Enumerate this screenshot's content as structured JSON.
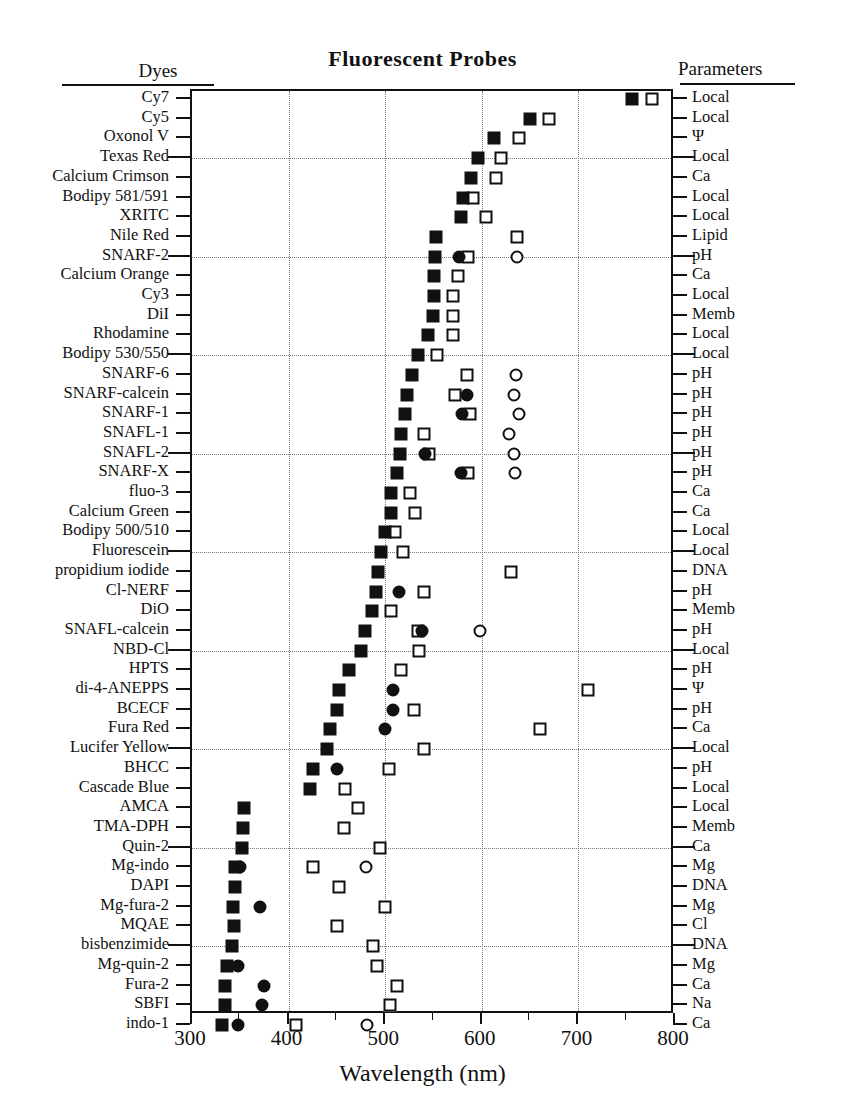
{
  "title": "Fluorescent  Probes",
  "headers": {
    "left": "Dyes",
    "right": "Parameters"
  },
  "chart_data": {
    "type": "scatter",
    "title": "Fluorescent  Probes",
    "xlabel": "Wavelength (nm)",
    "ylabel": "Dyes",
    "xlim": [
      300,
      800
    ],
    "xticks": [
      300,
      400,
      500,
      600,
      700,
      800
    ],
    "xtick_labels": [
      "300",
      "400",
      "500",
      "600",
      "700",
      "800"
    ],
    "xminor_ticks": [
      350,
      450,
      550,
      650,
      750
    ],
    "grid": "dotted, vertical every 100 nm, horizontal every 4th dye row",
    "legend": "none",
    "marker_meaning": {
      "filled-square": "primary excitation maximum",
      "filled-circle": "secondary excitation maximum",
      "open-square": "primary emission maximum",
      "open-circle": "secondary emission maximum"
    },
    "series": [
      {
        "name": "filled-square",
        "marker": "filled-square",
        "fill": "solid",
        "shape": "square"
      },
      {
        "name": "filled-circle",
        "marker": "filled-circle",
        "fill": "solid",
        "shape": "circle"
      },
      {
        "name": "open-square",
        "marker": "open-square",
        "fill": "open",
        "shape": "square"
      },
      {
        "name": "open-circle",
        "marker": "open-circle",
        "fill": "open",
        "shape": "circle"
      }
    ],
    "rows": [
      {
        "dye": "Cy7",
        "param": "Local",
        "filled_square": 755,
        "filled_circle": null,
        "open_square": 776,
        "open_circle": null
      },
      {
        "dye": "Cy5",
        "param": "Local",
        "filled_square": 650,
        "filled_circle": null,
        "open_square": 670,
        "open_circle": null
      },
      {
        "dye": "Oxonol V",
        "param": "Ψ",
        "filled_square": 613,
        "filled_circle": null,
        "open_square": 638,
        "open_circle": null
      },
      {
        "dye": "Texas Red",
        "param": "Local",
        "filled_square": 596,
        "filled_circle": null,
        "open_square": 620,
        "open_circle": null
      },
      {
        "dye": "Calcium Crimson",
        "param": "Ca",
        "filled_square": 589,
        "filled_circle": null,
        "open_square": 615,
        "open_circle": null
      },
      {
        "dye": "Bodipy 581/591",
        "param": "Local",
        "filled_square": 581,
        "filled_circle": null,
        "open_square": 591,
        "open_circle": null
      },
      {
        "dye": "XRITC",
        "param": "Local",
        "filled_square": 578,
        "filled_circle": null,
        "open_square": 604,
        "open_circle": null
      },
      {
        "dye": "Nile Red",
        "param": "Lipid",
        "filled_square": 553,
        "filled_circle": null,
        "open_square": 636,
        "open_circle": null
      },
      {
        "dye": "SNARF-2",
        "param": "pH",
        "filled_square": 552,
        "filled_circle": 576,
        "open_square": 586,
        "open_circle": 636
      },
      {
        "dye": "Calcium Orange",
        "param": "Ca",
        "filled_square": 550,
        "filled_circle": null,
        "open_square": 575,
        "open_circle": null
      },
      {
        "dye": "Cy3",
        "param": "Local",
        "filled_square": 550,
        "filled_circle": null,
        "open_square": 570,
        "open_circle": null
      },
      {
        "dye": "DiI",
        "param": "Memb",
        "filled_square": 549,
        "filled_circle": null,
        "open_square": 570,
        "open_circle": null
      },
      {
        "dye": "Rhodamine",
        "param": "Local",
        "filled_square": 544,
        "filled_circle": null,
        "open_square": 570,
        "open_circle": null
      },
      {
        "dye": "Bodipy 530/550",
        "param": "Local",
        "filled_square": 534,
        "filled_circle": null,
        "open_square": 554,
        "open_circle": null
      },
      {
        "dye": "SNARF-6",
        "param": "pH",
        "filled_square": 528,
        "filled_circle": null,
        "open_square": 585,
        "open_circle": 635
      },
      {
        "dye": "SNARF-calcein",
        "param": "pH",
        "filled_square": 523,
        "filled_circle": 585,
        "open_square": 572,
        "open_circle": 633
      },
      {
        "dye": "SNARF-1",
        "param": "pH",
        "filled_square": 521,
        "filled_circle": 580,
        "open_square": 588,
        "open_circle": 639
      },
      {
        "dye": "SNAFL-1",
        "param": "pH",
        "filled_square": 516,
        "filled_circle": null,
        "open_square": 540,
        "open_circle": 628
      },
      {
        "dye": "SNAFL-2",
        "param": "pH",
        "filled_square": 515,
        "filled_circle": 541,
        "open_square": 545,
        "open_circle": 633
      },
      {
        "dye": "SNARF-X",
        "param": "pH",
        "filled_square": 512,
        "filled_circle": 578,
        "open_square": 586,
        "open_circle": 634
      },
      {
        "dye": "fluo-3",
        "param": "Ca",
        "filled_square": 506,
        "filled_circle": null,
        "open_square": 526,
        "open_circle": null
      },
      {
        "dye": "Calcium Green",
        "param": "Ca",
        "filled_square": 506,
        "filled_circle": null,
        "open_square": 531,
        "open_circle": null
      },
      {
        "dye": "Bodipy 500/510",
        "param": "Local",
        "filled_square": 500,
        "filled_circle": null,
        "open_square": 510,
        "open_circle": null
      },
      {
        "dye": "Fluorescein",
        "param": "Local",
        "filled_square": 496,
        "filled_circle": null,
        "open_square": 518,
        "open_circle": null
      },
      {
        "dye": "propidium iodide",
        "param": "DNA",
        "filled_square": 493,
        "filled_circle": null,
        "open_square": 630,
        "open_circle": null
      },
      {
        "dye": "Cl-NERF",
        "param": "pH",
        "filled_square": 490,
        "filled_circle": 514,
        "open_square": 540,
        "open_circle": null
      },
      {
        "dye": "DiO",
        "param": "Memb",
        "filled_square": 486,
        "filled_circle": null,
        "open_square": 506,
        "open_circle": null
      },
      {
        "dye": "SNAFL-calcein",
        "param": "pH",
        "filled_square": 479,
        "filled_circle": 538,
        "open_square": 534,
        "open_circle": 598
      },
      {
        "dye": "NBD-Cl",
        "param": "Local",
        "filled_square": 475,
        "filled_circle": null,
        "open_square": 535,
        "open_circle": null
      },
      {
        "dye": "HPTS",
        "param": "pH",
        "filled_square": 463,
        "filled_circle": null,
        "open_square": 516,
        "open_circle": null
      },
      {
        "dye": "di-4-ANEPPS",
        "param": "Ψ",
        "filled_square": 452,
        "filled_circle": 508,
        "open_square": 710,
        "open_circle": null
      },
      {
        "dye": "BCECF",
        "param": "pH",
        "filled_square": 450,
        "filled_circle": 508,
        "open_square": 530,
        "open_circle": null
      },
      {
        "dye": "Fura Red",
        "param": "Ca",
        "filled_square": 443,
        "filled_circle": 500,
        "open_square": 660,
        "open_circle": null
      },
      {
        "dye": "Lucifer Yellow",
        "param": "Local",
        "filled_square": 440,
        "filled_circle": null,
        "open_square": 540,
        "open_circle": null
      },
      {
        "dye": "BHCC",
        "param": "pH",
        "filled_square": 425,
        "filled_circle": 450,
        "open_square": 504,
        "open_circle": null
      },
      {
        "dye": "Cascade Blue",
        "param": "Local",
        "filled_square": 422,
        "filled_circle": null,
        "open_square": 458,
        "open_circle": null
      },
      {
        "dye": "AMCA",
        "param": "Local",
        "filled_square": 354,
        "filled_circle": null,
        "open_square": 472,
        "open_circle": null
      },
      {
        "dye": "TMA-DPH",
        "param": "Memb",
        "filled_square": 353,
        "filled_circle": null,
        "open_square": 457,
        "open_circle": null
      },
      {
        "dye": "Quin-2",
        "param": "Ca",
        "filled_square": 352,
        "filled_circle": null,
        "open_square": 495,
        "open_circle": null
      },
      {
        "dye": "Mg-indo",
        "param": "Mg",
        "filled_square": 345,
        "filled_circle": 350,
        "open_square": 425,
        "open_circle": 480
      },
      {
        "dye": "DAPI",
        "param": "DNA",
        "filled_square": 344,
        "filled_circle": null,
        "open_square": 452,
        "open_circle": null
      },
      {
        "dye": "Mg-fura-2",
        "param": "Mg",
        "filled_square": 342,
        "filled_circle": 370,
        "open_square": 500,
        "open_circle": null
      },
      {
        "dye": "MQAE",
        "param": "Cl",
        "filled_square": 343,
        "filled_circle": null,
        "open_square": 450,
        "open_circle": null
      },
      {
        "dye": "bisbenzimide",
        "param": "DNA",
        "filled_square": 341,
        "filled_circle": null,
        "open_square": 487,
        "open_circle": null
      },
      {
        "dye": "Mg-quin-2",
        "param": "Mg",
        "filled_square": 336,
        "filled_circle": 348,
        "open_square": 492,
        "open_circle": null
      },
      {
        "dye": "Fura-2",
        "param": "Ca",
        "filled_square": 334,
        "filled_circle": 375,
        "open_square": 512,
        "open_circle": null
      },
      {
        "dye": "SBFI",
        "param": "Na",
        "filled_square": 334,
        "filled_circle": 372,
        "open_square": 505,
        "open_circle": null
      },
      {
        "dye": "indo-1",
        "param": "Ca",
        "filled_square": 331,
        "filled_circle": 348,
        "open_square": 408,
        "open_circle": 481
      }
    ]
  }
}
